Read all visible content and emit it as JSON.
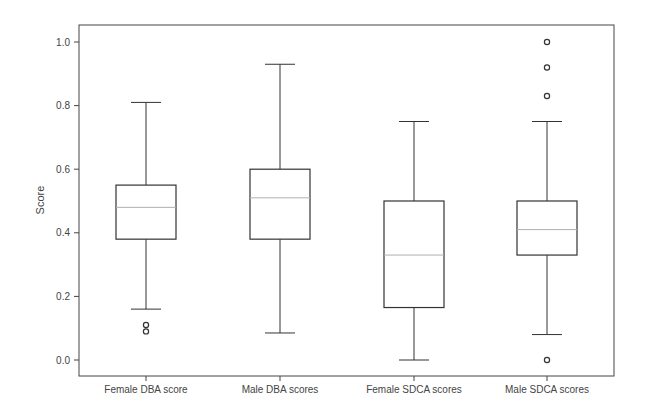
{
  "chart_data": {
    "type": "box",
    "title": "",
    "xlabel": "",
    "ylabel": "Score",
    "ylim": [
      -0.05,
      1.05
    ],
    "yticks": [
      0.0,
      0.2,
      0.4,
      0.6,
      0.8,
      1.0
    ],
    "ytick_labels": [
      "0.0",
      "0.2",
      "0.4",
      "0.6",
      "0.8",
      "1.0"
    ],
    "grid": false,
    "legend": null,
    "categories": [
      "Female DBA score",
      "Male DBA scores",
      "Female SDCA scores",
      "Male SDCA scores"
    ],
    "series": [
      {
        "name": "Female DBA score",
        "whisker_low": 0.16,
        "q1": 0.38,
        "median": 0.48,
        "q3": 0.55,
        "whisker_high": 0.81,
        "outliers": [
          0.11,
          0.09
        ]
      },
      {
        "name": "Male DBA scores",
        "whisker_low": 0.085,
        "q1": 0.38,
        "median": 0.51,
        "q3": 0.6,
        "whisker_high": 0.93,
        "outliers": []
      },
      {
        "name": "Female SDCA scores",
        "whisker_low": 0.0,
        "q1": 0.165,
        "median": 0.33,
        "q3": 0.5,
        "whisker_high": 0.75,
        "outliers": []
      },
      {
        "name": "Male SDCA scores",
        "whisker_low": 0.08,
        "q1": 0.33,
        "median": 0.41,
        "q3": 0.5,
        "whisker_high": 0.75,
        "outliers": [
          1.0,
          0.92,
          0.83,
          0.0
        ]
      }
    ],
    "colors": {
      "box": "#333333",
      "median": "#b0b0b0",
      "axis": "#444444"
    }
  }
}
